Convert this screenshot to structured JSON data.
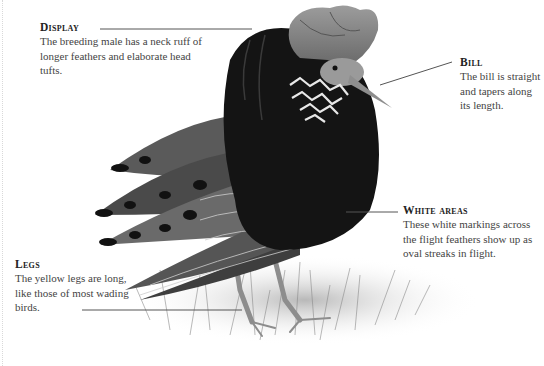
{
  "palette": {
    "text": "#444444",
    "heading": "#222222",
    "leader_line": "#555555",
    "plumage_dark": "#151515",
    "plumage_mid": "#6e6e6e",
    "plumage_light": "#d8d8d8"
  },
  "annotations": [
    {
      "id": "display",
      "heading": "Display",
      "body": "The breeding male has a neck ruff of longer feathers and elaborate head tufts."
    },
    {
      "id": "bill",
      "heading": "Bill",
      "body": "The bill is straight and tapers along its length."
    },
    {
      "id": "white-areas",
      "heading": "White areas",
      "body": "These white markings across the flight feathers show up as oval streaks in flight."
    },
    {
      "id": "legs",
      "heading": "Legs",
      "body": "The yellow legs are long, like those of most wading birds."
    }
  ]
}
